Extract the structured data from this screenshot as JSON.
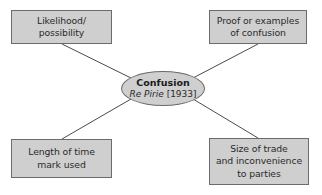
{
  "diagram": {
    "type": "mind-map",
    "center": {
      "title": "Confusion",
      "case_name": "Re Pirie",
      "case_year": "[1933]"
    },
    "nodes": [
      {
        "id": "top-left",
        "lines": [
          "Likelihood/",
          "possibility"
        ]
      },
      {
        "id": "top-right",
        "lines": [
          "Proof or examples",
          "of confusion"
        ]
      },
      {
        "id": "bottom-left",
        "lines": [
          "Length of time",
          "mark used"
        ]
      },
      {
        "id": "bottom-right",
        "lines": [
          "Size of trade",
          "and inconvenience",
          "to parties"
        ]
      }
    ],
    "colors": {
      "box_fill": "#cfcfcf",
      "box_border": "#6b6b6b",
      "connector": "#4a4a4a",
      "background": "#ffffff"
    }
  }
}
